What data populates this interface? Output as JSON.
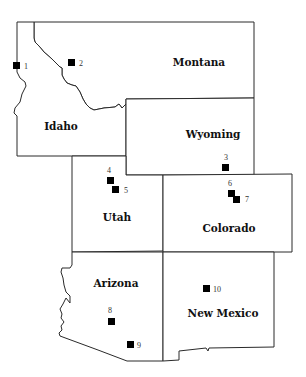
{
  "map": {
    "type": "regional outline map",
    "region": "Western United States",
    "states": [
      {
        "name": "Montana",
        "label_x": 199,
        "label_y": 66
      },
      {
        "name": "Idaho",
        "label_x": 61,
        "label_y": 130
      },
      {
        "name": "Wyoming",
        "label_x": 213,
        "label_y": 138
      },
      {
        "name": "Utah",
        "label_x": 117,
        "label_y": 221
      },
      {
        "name": "Colorado",
        "label_x": 229,
        "label_y": 232
      },
      {
        "name": "Arizona",
        "label_x": 116,
        "label_y": 287
      },
      {
        "name": "New Mexico",
        "label_x": 223,
        "label_y": 317
      }
    ],
    "sites": [
      {
        "id": "1",
        "x": 17,
        "y": 66,
        "label_pos": "right"
      },
      {
        "id": "2",
        "x": 72,
        "y": 63,
        "label_pos": "right"
      },
      {
        "id": "3",
        "x": 226,
        "y": 167,
        "label_pos": "top"
      },
      {
        "id": "4",
        "x": 111,
        "y": 180,
        "label_pos": "top"
      },
      {
        "id": "5",
        "x": 115,
        "y": 190,
        "label_pos": "right"
      },
      {
        "id": "6",
        "x": 231,
        "y": 193,
        "label_pos": "top"
      },
      {
        "id": "7",
        "x": 236,
        "y": 199,
        "label_pos": "right"
      },
      {
        "id": "8",
        "x": 112,
        "y": 322,
        "label_pos": "top"
      },
      {
        "id": "9",
        "x": 131,
        "y": 345,
        "label_pos": "right"
      },
      {
        "id": "10",
        "x": 206,
        "y": 289,
        "label_pos": "right"
      }
    ],
    "colors": {
      "background": "#ffffff",
      "border": "#2a2a2a",
      "marker": "#000000",
      "text": "#111111"
    }
  }
}
